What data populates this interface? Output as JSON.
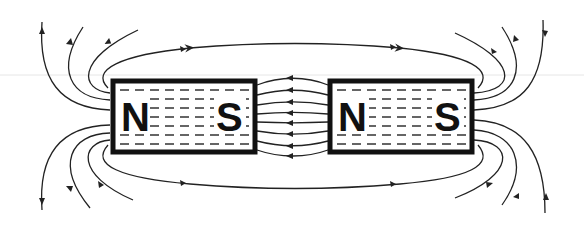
{
  "diagram": {
    "magnets": [
      {
        "id": "left",
        "poles": {
          "left": "N",
          "right": "S"
        }
      },
      {
        "id": "right",
        "poles": {
          "left": "N",
          "right": "S"
        }
      }
    ],
    "labels": {
      "m1_left": "N",
      "m1_right": "S",
      "m2_left": "N",
      "m2_right": "S"
    },
    "colors": {
      "line": "#222222",
      "background": "#ffffff"
    }
  }
}
